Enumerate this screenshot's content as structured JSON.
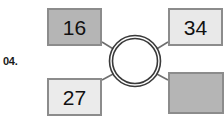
{
  "question": {
    "number": "04."
  },
  "diagram": {
    "type": "number-wheel",
    "center": {
      "name": "hub-circle",
      "label": "",
      "style": "double-ring"
    },
    "nodes": [
      {
        "position": "top-left",
        "value": "16",
        "empty": false,
        "fill": "#b5b5b5",
        "border": "#8c8c8c"
      },
      {
        "position": "top-right",
        "value": "34",
        "empty": false,
        "fill": "#e9e9e9",
        "border": "#8c8c8c"
      },
      {
        "position": "bottom-left",
        "value": "27",
        "empty": false,
        "fill": "#ebebeb",
        "border": "#8c8c8c"
      },
      {
        "position": "bottom-right",
        "value": "",
        "empty": true,
        "fill": "#b5b5b5",
        "border": "#8c8c8c"
      }
    ],
    "connectors": [
      {
        "from": "hub-circle",
        "to": "top-left"
      },
      {
        "from": "hub-circle",
        "to": "top-right"
      },
      {
        "from": "hub-circle",
        "to": "bottom-left"
      },
      {
        "from": "hub-circle",
        "to": "bottom-right"
      }
    ],
    "colors": {
      "line": "#6e6e6e",
      "circle_stroke": "#3a3a3a",
      "page_background": "#ffffff",
      "text": "#111111"
    }
  }
}
